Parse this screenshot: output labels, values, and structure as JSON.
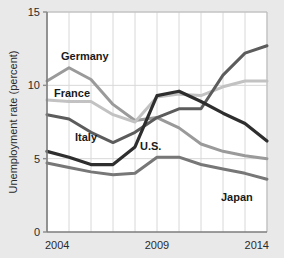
{
  "chart_data": {
    "type": "line",
    "title": "",
    "xlabel": "",
    "ylabel": "Unemployment rate (percent)",
    "xlim": [
      2004,
      2014
    ],
    "ylim": [
      0,
      15
    ],
    "grid": true,
    "legend_position": "inline-labels",
    "x": [
      2004,
      2005,
      2006,
      2007,
      2008,
      2009,
      2010,
      2011,
      2012,
      2013,
      2014
    ],
    "xticks": [
      2004,
      2009,
      2014
    ],
    "xtick_labels": [
      "2004",
      "2009",
      "2014"
    ],
    "yticks": [
      0,
      5,
      10,
      15
    ],
    "ytick_labels": [
      "0",
      "5",
      "10",
      "15"
    ],
    "series": [
      {
        "name": "Germany",
        "label": "Germany",
        "color": "#9a9a9a",
        "width": 3.0,
        "values": [
          10.3,
          11.2,
          10.4,
          8.7,
          7.6,
          7.8,
          7.1,
          6.0,
          5.5,
          5.2,
          5.0
        ]
      },
      {
        "name": "France",
        "label": "France",
        "color": "#c2c2c2",
        "width": 3.0,
        "values": [
          9.0,
          8.9,
          8.9,
          8.0,
          7.5,
          9.2,
          9.4,
          9.3,
          9.9,
          10.3,
          10.3
        ]
      },
      {
        "name": "Italy",
        "label": "Italy",
        "color": "#5c5c5c",
        "width": 3.0,
        "values": [
          8.0,
          7.7,
          6.8,
          6.1,
          6.8,
          7.8,
          8.4,
          8.4,
          10.7,
          12.2,
          12.7
        ]
      },
      {
        "name": "U.S.",
        "label": "U.S.",
        "color": "#2e2e2e",
        "width": 3.2,
        "values": [
          5.5,
          5.1,
          4.6,
          4.6,
          5.8,
          9.3,
          9.6,
          8.9,
          8.1,
          7.4,
          6.2
        ]
      },
      {
        "name": "Japan",
        "label": "Japan",
        "color": "#777777",
        "width": 3.0,
        "values": [
          4.7,
          4.4,
          4.1,
          3.9,
          4.0,
          5.1,
          5.1,
          4.6,
          4.3,
          4.0,
          3.6
        ]
      }
    ],
    "annotations": [
      {
        "text": "Germany",
        "x_px": 61,
        "y_px": 60
      },
      {
        "text": "France",
        "x_px": 54,
        "y_px": 97
      },
      {
        "text": "Italy",
        "x_px": 75,
        "y_px": 141
      },
      {
        "text": "U.S.",
        "x_px": 140,
        "y_px": 150
      },
      {
        "text": "Japan",
        "x_px": 221,
        "y_px": 201
      }
    ],
    "colors": {
      "background": "#e9e9e9",
      "plot_background": "#ffffff",
      "grid": "#d8d8d8",
      "axis": "#8c8c8c",
      "text": "#2b2b2b"
    }
  }
}
